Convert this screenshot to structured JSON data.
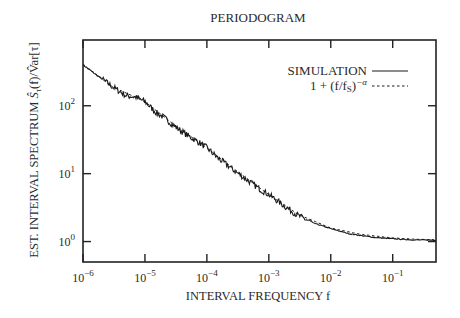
{
  "chart_data": {
    "type": "line",
    "title": "PERIODOGRAM",
    "xlabel": "INTERVAL FREQUENCY f",
    "ylabel": "EST. INTERVAL SPECTRUM Ŝτ(f)/V̂ar[τ]",
    "xscale": "log",
    "yscale": "log",
    "xlim": [
      1e-06,
      0.5
    ],
    "ylim": [
      0.5,
      930
    ],
    "grid": false,
    "legend_position": "upper right",
    "x_ticks": [
      1e-06,
      1e-05,
      0.0001,
      0.001,
      0.01,
      0.1
    ],
    "x_tick_labels": [
      {
        "base": "10",
        "exp": "−6"
      },
      {
        "base": "10",
        "exp": "−5"
      },
      {
        "base": "10",
        "exp": "−4"
      },
      {
        "base": "10",
        "exp": "−3"
      },
      {
        "base": "10",
        "exp": "−2"
      },
      {
        "base": "10",
        "exp": "−1"
      }
    ],
    "y_ticks": [
      1,
      10,
      100
    ],
    "y_tick_labels": [
      {
        "base": "10",
        "exp": "0"
      },
      {
        "base": "10",
        "exp": "1"
      },
      {
        "base": "10",
        "exp": "2"
      }
    ],
    "series": [
      {
        "name": "SIMULATION",
        "style": "solid",
        "x": [
          1e-06,
          2e-06,
          3e-06,
          5e-06,
          7e-06,
          1e-05,
          1.5e-05,
          2e-05,
          3e-05,
          5e-05,
          7e-05,
          0.0001,
          0.00015,
          0.0002,
          0.0003,
          0.0005,
          0.0007,
          0.001,
          0.002,
          0.003,
          0.005,
          0.01,
          0.02,
          0.05,
          0.1,
          0.2,
          0.5
        ],
        "values": [
          400,
          250,
          190,
          140,
          135,
          115,
          80,
          68,
          50,
          36,
          30,
          24,
          17,
          14,
          10.5,
          7.5,
          6.0,
          4.9,
          3.1,
          2.4,
          1.9,
          1.55,
          1.3,
          1.15,
          1.1,
          1.06,
          1.05
        ]
      },
      {
        "name": "1 + (f/f_S)^−α",
        "style": "dashed",
        "x": [
          1e-06,
          3e-06,
          1e-05,
          3e-05,
          0.0001,
          0.0003,
          0.001,
          0.003,
          0.01,
          0.03,
          0.1,
          0.2,
          0.5
        ],
        "values": [
          400,
          190,
          115,
          52,
          24,
          11,
          4.9,
          2.5,
          1.58,
          1.28,
          1.13,
          1.09,
          1.06
        ]
      }
    ]
  },
  "legend": {
    "entries": [
      {
        "label": "SIMULATION",
        "style": "solid"
      },
      {
        "label_prefix": "1 + (f/f",
        "label_sub": "S",
        "label_mid": ")",
        "label_sup": "−α",
        "style": "dashed"
      }
    ]
  },
  "colors": {
    "line": "#1a1a1a",
    "axis": "#222222",
    "text": "#2a2a2a",
    "background": "#ffffff"
  }
}
